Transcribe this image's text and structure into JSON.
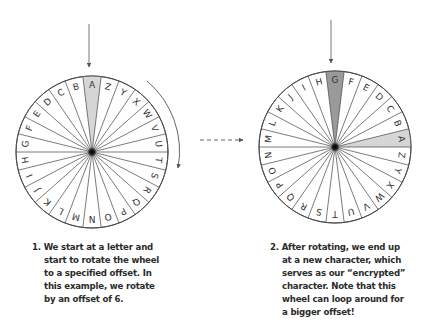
{
  "colors": {
    "wheel_stroke": "#444444",
    "start_highlight": "#d6d6d6",
    "result_highlight": "#9a9a9a",
    "arrow": "#666666",
    "hub": "#111111",
    "text": "#2b2b2b"
  },
  "wheels": [
    {
      "id": "start-wheel",
      "cx": 92,
      "cy": 152,
      "r": 76,
      "top_letter": "A",
      "letters_clockwise_from_top": [
        "A",
        "Z",
        "Y",
        "X",
        "W",
        "V",
        "U",
        "T",
        "S",
        "R",
        "Q",
        "P",
        "O",
        "N",
        "M",
        "L",
        "K",
        "J",
        "I",
        "H",
        "G",
        "F",
        "E",
        "D",
        "C",
        "B"
      ],
      "highlights": [
        {
          "letter": "A",
          "shade": "start_highlight"
        }
      ],
      "pointer": {
        "x": 89,
        "y1": 24,
        "y2": 67
      }
    },
    {
      "id": "rotated-wheel",
      "cx": 335,
      "cy": 147,
      "r": 76,
      "top_letter": "G",
      "letters_clockwise_from_top": [
        "G",
        "F",
        "E",
        "D",
        "C",
        "B",
        "A",
        "Z",
        "Y",
        "X",
        "W",
        "V",
        "U",
        "T",
        "S",
        "R",
        "Q",
        "P",
        "O",
        "N",
        "M",
        "L",
        "K",
        "J",
        "I",
        "H"
      ],
      "highlights": [
        {
          "letter": "G",
          "shade": "result_highlight"
        },
        {
          "letter": "A",
          "shade": "start_highlight"
        }
      ],
      "pointer": {
        "x": 331,
        "y1": 20,
        "y2": 63
      }
    }
  ],
  "rotation": {
    "label": "offset",
    "offset": 6,
    "direction": "clockwise"
  },
  "captions": {
    "step1": {
      "lines": [
        "1. We start at a letter and",
        "start to rotate the wheel",
        "to a specified offset. In",
        "this example, we rotate",
        "by an offset of 6."
      ]
    },
    "step2": {
      "lines": [
        "2. After rotating, we end up",
        "at a new character, which",
        "serves as our “encrypted”",
        "character. Note that this",
        "wheel can loop around for",
        "a bigger offset!"
      ]
    }
  }
}
